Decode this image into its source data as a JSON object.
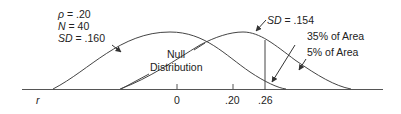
{
  "diagram": {
    "type": "overlapping-normal-distributions",
    "axis_label": "r",
    "ticks": [
      {
        "label": "0",
        "value": 0
      },
      {
        "label": ".20",
        "value": 0.2
      },
      {
        "label": ".26",
        "value": 0.26
      }
    ],
    "null_distribution": {
      "label_line1": "Null",
      "label_line2": "Distribution",
      "params": {
        "rho_symbol": "ρ",
        "rho": "= .20",
        "n_symbol": "N",
        "n": "= 40",
        "sd_symbol": "SD",
        "sd": "= .160"
      }
    },
    "alternative_distribution": {
      "sd_symbol": "SD",
      "sd": "= .154"
    },
    "annotations": {
      "area_35": "35% of Area",
      "area_5": "5% of Area"
    },
    "colors": {
      "line": "#333333",
      "background": "#ffffff"
    }
  }
}
